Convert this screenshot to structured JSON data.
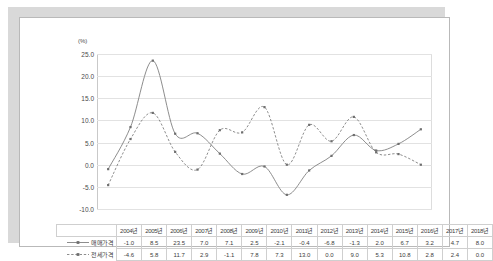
{
  "chart_data": {
    "type": "line",
    "title": "",
    "subtitle": "",
    "xlabel": "",
    "ylabel": "",
    "unit_label": "(%)",
    "ylim": [
      -10.0,
      25.0
    ],
    "ytick_step": 5.0,
    "yticks": [
      "25.0",
      "20.0",
      "15.0",
      "10.0",
      "5.0",
      "0.0",
      "-5.0",
      "-10.0"
    ],
    "ytick_values": [
      25.0,
      20.0,
      15.0,
      10.0,
      5.0,
      0.0,
      -5.0,
      -10.0
    ],
    "grid": "horizontal",
    "legend_position": "table-left",
    "categories": [
      "2004년",
      "2005년",
      "2006년",
      "2007년",
      "2008년",
      "2009년",
      "2010년",
      "2011년",
      "2012년",
      "2013년",
      "2014년",
      "2015년",
      "2016년",
      "2017년",
      "2018년"
    ],
    "series": [
      {
        "name": "매매가격",
        "style": "solid",
        "marker": "square",
        "color": "#808080",
        "values": [
          -1.0,
          8.5,
          23.5,
          7.0,
          7.1,
          2.5,
          -2.1,
          -0.4,
          -6.8,
          -1.3,
          2.0,
          6.7,
          3.2,
          4.7,
          8.0
        ],
        "labels": [
          "-1.0",
          "8.5",
          "23.5",
          "7.0",
          "7.1",
          "2.5",
          "-2.1",
          "-0.4",
          "-6.8",
          "-1.3",
          "2.0",
          "6.7",
          "3.2",
          "4.7",
          "8.0"
        ]
      },
      {
        "name": "전세가격",
        "style": "dashed",
        "marker": "square",
        "color": "#808080",
        "values": [
          -4.6,
          5.8,
          11.7,
          2.9,
          -1.1,
          7.8,
          7.3,
          13.0,
          0.0,
          9.0,
          5.3,
          10.8,
          2.8,
          2.4,
          0.0
        ],
        "labels": [
          "-4.6",
          "5.8",
          "11.7",
          "2.9",
          "-1.1",
          "7.8",
          "7.3",
          "13.0",
          "0.0",
          "9.0",
          "5.3",
          "10.8",
          "2.8",
          "2.4",
          "0.0"
        ]
      }
    ]
  }
}
